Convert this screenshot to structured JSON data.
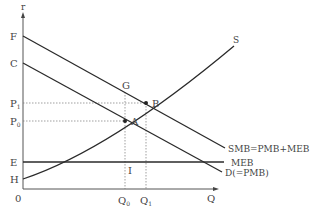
{
  "diagram": {
    "type": "economics-externality-diagram",
    "axes": {
      "y_label": "r",
      "x_label": "Q",
      "origin_label": "0"
    },
    "y_axis_points": [
      {
        "id": "F",
        "label": "F"
      },
      {
        "id": "C",
        "label": "C"
      },
      {
        "id": "P1",
        "label": "P",
        "sub": "1"
      },
      {
        "id": "P0",
        "label": "P",
        "sub": "0"
      },
      {
        "id": "E",
        "label": "E"
      },
      {
        "id": "H",
        "label": "H"
      }
    ],
    "x_axis_points": [
      {
        "id": "Q0",
        "label": "Q",
        "sub": "0"
      },
      {
        "id": "Q1",
        "label": "Q",
        "sub": "1"
      }
    ],
    "curves": [
      {
        "id": "SMB",
        "label": "SMB=PMB+MEB",
        "kind": "line",
        "from": "F"
      },
      {
        "id": "D",
        "label": "D(=PMB)",
        "kind": "line",
        "from": "C"
      },
      {
        "id": "MEB",
        "label": "MEB",
        "kind": "horizontal",
        "from": "E"
      },
      {
        "id": "S",
        "label": "S",
        "kind": "convex-curve",
        "from": "H"
      }
    ],
    "points": [
      {
        "id": "A",
        "label": "A",
        "desc": "D ∩ S at (Q0, P0)"
      },
      {
        "id": "B",
        "label": "B",
        "desc": "SMB ∩ S at (Q1, P1)"
      },
      {
        "id": "G",
        "label": "G",
        "desc": "SMB at Q0"
      },
      {
        "id": "I",
        "label": "I",
        "desc": "MEB at Q0"
      }
    ],
    "colors": {
      "line": "#2a2a2a",
      "text": "#444444",
      "guide": "#777777"
    }
  }
}
